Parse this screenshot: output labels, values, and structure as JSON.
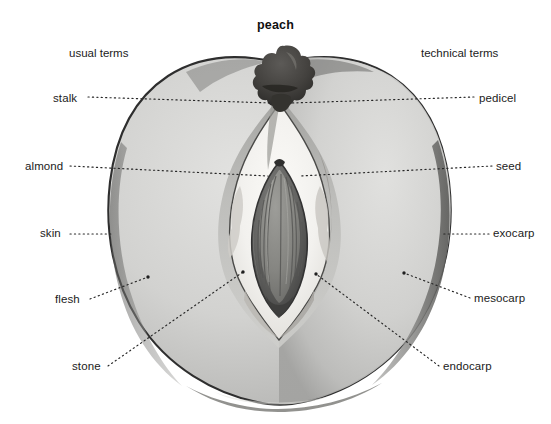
{
  "title": "peach",
  "headings": {
    "left": "usual terms",
    "right": "technical terms"
  },
  "colors": {
    "background": "#ffffff",
    "text": "#1b1b1b",
    "leader_line": "#2b2b2b",
    "skin_outline": "#3a3a3a",
    "flesh_light": "#d8d8d6",
    "flesh_mid": "#c3c3c1",
    "flesh_dark": "#a8a8a6",
    "cavity_white": "#f4f3f0",
    "stone_dark": "#4f4f4f",
    "stone_mid": "#6e6e6e",
    "seed_body": "#8a8a86",
    "stem_dark": "#3c3b39"
  },
  "labels": {
    "usual": [
      {
        "id": "stalk",
        "text": "stalk",
        "x": 53,
        "y": 92
      },
      {
        "id": "almond",
        "text": "almond",
        "x": 25,
        "y": 160
      },
      {
        "id": "skin",
        "text": "skin",
        "x": 40,
        "y": 227
      },
      {
        "id": "flesh",
        "text": "flesh",
        "x": 55,
        "y": 293
      },
      {
        "id": "stone",
        "text": "stone",
        "x": 72,
        "y": 360
      }
    ],
    "technical": [
      {
        "id": "pedicel",
        "text": "pedicel",
        "x": 479,
        "y": 92
      },
      {
        "id": "seed",
        "text": "seed",
        "x": 496,
        "y": 160
      },
      {
        "id": "exocarp",
        "text": "exocarp",
        "x": 493,
        "y": 227
      },
      {
        "id": "mesocarp",
        "text": "mesocarp",
        "x": 474,
        "y": 292
      },
      {
        "id": "endocarp",
        "text": "endocarp",
        "x": 443,
        "y": 360
      }
    ]
  },
  "leaders": [
    {
      "id": "stalk-leader",
      "x1": 88,
      "y1": 97,
      "x2": 272,
      "y2": 103
    },
    {
      "id": "pedicel-leader",
      "x1": 474,
      "y1": 97,
      "x2": 292,
      "y2": 103
    },
    {
      "id": "almond-leader",
      "x1": 70,
      "y1": 166,
      "x2": 268,
      "y2": 176
    },
    {
      "id": "seed-leader",
      "x1": 492,
      "y1": 166,
      "x2": 300,
      "y2": 176
    },
    {
      "id": "skin-leader",
      "x1": 70,
      "y1": 234,
      "x2": 113,
      "y2": 234
    },
    {
      "id": "exocarp-leader",
      "x1": 489,
      "y1": 234,
      "x2": 441,
      "y2": 234
    },
    {
      "id": "flesh-leader",
      "x1": 90,
      "y1": 299,
      "x2": 148,
      "y2": 277
    },
    {
      "id": "mesocarp-leader",
      "x1": 470,
      "y1": 298,
      "x2": 404,
      "y2": 273
    },
    {
      "id": "stone-leader",
      "x1": 108,
      "y1": 366,
      "x2": 243,
      "y2": 272
    },
    {
      "id": "endocarp-leader",
      "x1": 439,
      "y1": 366,
      "x2": 316,
      "y2": 274
    }
  ]
}
